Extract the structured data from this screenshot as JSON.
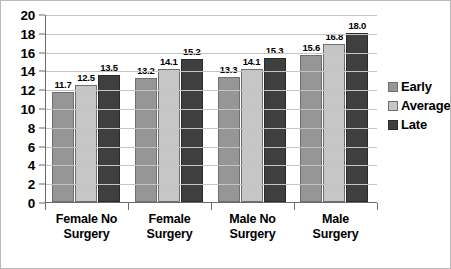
{
  "chart_data": {
    "type": "bar",
    "title": "",
    "subtitle": "",
    "xlabel": "",
    "ylabel": "",
    "ylim": [
      0,
      20
    ],
    "ytick_step": 2,
    "yticks": [
      "20",
      "18",
      "16",
      "14",
      "12",
      "10",
      "8",
      "6",
      "4",
      "2",
      "0"
    ],
    "grid": true,
    "legend_position": "right",
    "categories": [
      "Female No Surgery",
      "Female Surgery",
      "Male No Surgery",
      "Male Surgery"
    ],
    "category_lines": [
      [
        "Female No",
        "Surgery"
      ],
      [
        "Female",
        "Surgery"
      ],
      [
        "Male No",
        "Surgery"
      ],
      [
        "Male",
        "Surgery"
      ]
    ],
    "series": [
      {
        "name": "Early",
        "color": "#969696",
        "values": [
          11.7,
          13.2,
          13.3,
          15.6
        ],
        "labels": [
          "11.7",
          "13.2",
          "13.3",
          "15.6"
        ]
      },
      {
        "name": "Average",
        "color": "#c6c6c6",
        "values": [
          12.5,
          14.1,
          14.1,
          16.8
        ],
        "labels": [
          "12.5",
          "14.1",
          "14.1",
          "16.8"
        ]
      },
      {
        "name": "Late",
        "color": "#3f3f3f",
        "values": [
          13.5,
          15.2,
          15.3,
          18.0
        ],
        "labels": [
          "13.5",
          "15.2",
          "15.3",
          "18.0"
        ]
      }
    ]
  },
  "legend": {
    "items": [
      {
        "label": "Early"
      },
      {
        "label": "Average"
      },
      {
        "label": "Late"
      }
    ]
  }
}
